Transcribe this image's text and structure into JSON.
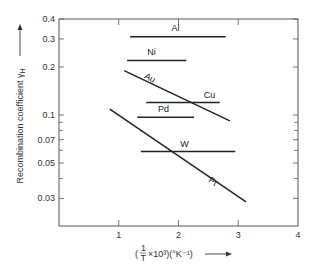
{
  "chart_data": {
    "type": "line",
    "title": "",
    "xlabel": "(1/T ×10³)(°K⁻¹)",
    "ylabel": "Recombination coefficient γH",
    "xlim": [
      0,
      4
    ],
    "ylim": [
      0.02,
      0.4
    ],
    "yscale": "log",
    "grid": false,
    "legend": "inline labels",
    "x_ticks": [
      "1",
      "2",
      "3",
      "4"
    ],
    "y_ticks": [
      "0.4",
      "0.3",
      "0.2",
      "0.1",
      "0.07",
      "0.05",
      "0.03"
    ],
    "y_minor_ticks": [
      0.09,
      0.08,
      0.06,
      0.04
    ],
    "series": [
      {
        "name": "Al",
        "x": [
          1.19,
          2.79
        ],
        "y": [
          0.31,
          0.31
        ],
        "label_pos": [
          1.95,
          0.335
        ]
      },
      {
        "name": "Ni",
        "x": [
          1.14,
          2.13
        ],
        "y": [
          0.22,
          0.22
        ],
        "label_pos": [
          1.55,
          0.238
        ]
      },
      {
        "name": "Au",
        "x": [
          1.09,
          2.86
        ],
        "y": [
          0.19,
          0.092
        ],
        "label_pos": [
          1.5,
          0.165
        ],
        "label_angle": 28
      },
      {
        "name": "Cu",
        "x": [
          1.46,
          2.69
        ],
        "y": [
          0.12,
          0.12
        ],
        "label_pos": [
          2.52,
          0.128
        ]
      },
      {
        "name": "Pd",
        "x": [
          1.31,
          2.26
        ],
        "y": [
          0.097,
          0.097
        ],
        "label_pos": [
          1.75,
          0.104
        ]
      },
      {
        "name": "W",
        "x": [
          1.37,
          2.95
        ],
        "y": [
          0.059,
          0.059
        ],
        "label_pos": [
          2.1,
          0.063
        ]
      },
      {
        "name": "Pt",
        "x": [
          0.85,
          3.13
        ],
        "y": [
          0.109,
          0.0285
        ],
        "label_pos": [
          2.55,
          0.037
        ],
        "label_angle": 33
      }
    ]
  },
  "axes": {
    "ylabel_text": "Recombination coefficient γ",
    "ylabel_sub": "H",
    "xlabel_prefix": "(",
    "xlabel_frac_num": "1",
    "xlabel_frac_den": "T",
    "xlabel_rest": "×10³)(°K⁻¹)"
  }
}
